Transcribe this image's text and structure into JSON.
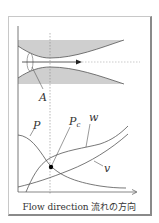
{
  "figure": {
    "caption": "Flow direction 流れの方向",
    "labels": {
      "nozzle_point": "A",
      "pressure": "P",
      "critical_pressure_main": "P",
      "critical_pressure_sub": "c",
      "velocity_w": "w",
      "volume_v": "v"
    },
    "colors": {
      "shading": "#cfcfcf",
      "line": "#555555",
      "guide": "#888888",
      "marker": "#000000"
    }
  }
}
